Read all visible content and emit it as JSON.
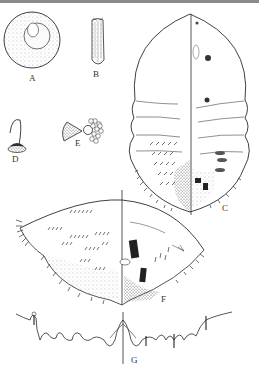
{
  "figure": {
    "panels": [
      {
        "id": "A",
        "label": "A",
        "subject": "egg"
      },
      {
        "id": "B",
        "label": "B",
        "subject": "crawler / first instar"
      },
      {
        "id": "C",
        "label": "C",
        "subject": "adult female, dorsal/ventral split view"
      },
      {
        "id": "D",
        "label": "D",
        "subject": "tubular duct / seta detail"
      },
      {
        "id": "E",
        "label": "E",
        "subject": "multilocular pore / spiracle detail"
      },
      {
        "id": "F",
        "label": "F",
        "subject": "pygidium / posterior abdomen split view"
      },
      {
        "id": "G",
        "label": "G",
        "subject": "anal lobes and marginal fringe"
      }
    ]
  },
  "colors": {
    "ink": "#2a2a2a",
    "stipple": "#555555",
    "topbar": "#8a8a8a",
    "background": "#ffffff"
  }
}
